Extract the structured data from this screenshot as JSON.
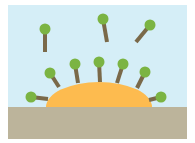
{
  "diagram": {
    "frame": {
      "x": 8,
      "y": 5,
      "width": 179,
      "height": 134
    },
    "colors": {
      "sky": "#d5eef7",
      "ground": "#bcb49b",
      "droplet": "#fdbb4f",
      "head": "#7bb443",
      "tail": "#7a6949"
    },
    "ground": {
      "y": 107
    },
    "droplet": {
      "cx": 99,
      "cy": 107,
      "rx": 53,
      "ry": 25
    },
    "free_molecules": [
      {
        "head": [
          45,
          29
        ],
        "tail_end": [
          45,
          52
        ]
      },
      {
        "head": [
          103,
          19
        ],
        "tail_end": [
          107,
          42
        ]
      },
      {
        "head": [
          150,
          25
        ],
        "tail_end": [
          136,
          42
        ]
      }
    ],
    "adsorbed_molecules": [
      {
        "head": [
          31,
          97
        ],
        "tail_end": [
          48,
          99
        ]
      },
      {
        "head": [
          50,
          73
        ],
        "tail_end": [
          59,
          87
        ]
      },
      {
        "head": [
          75,
          64
        ],
        "tail_end": [
          78,
          83
        ]
      },
      {
        "head": [
          99,
          62
        ],
        "tail_end": [
          100,
          82
        ]
      },
      {
        "head": [
          123,
          64
        ],
        "tail_end": [
          117,
          83
        ]
      },
      {
        "head": [
          145,
          72
        ],
        "tail_end": [
          137,
          88
        ]
      },
      {
        "head": [
          161,
          97
        ],
        "tail_end": [
          149,
          100
        ]
      }
    ],
    "head_radius": 5.5,
    "tail_width": 4
  }
}
